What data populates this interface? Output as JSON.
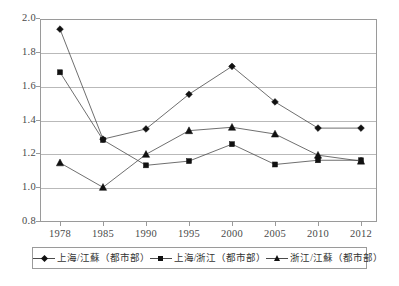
{
  "chart_data": {
    "type": "line",
    "title": "",
    "subtitle": "",
    "xlabel": "",
    "ylabel": "",
    "categories": [
      "1978",
      "1985",
      "1990",
      "1995",
      "2000",
      "2005",
      "2010",
      "2012"
    ],
    "ylim": [
      0.8,
      2.0
    ],
    "yticks": [
      "0.8",
      "1.0",
      "1.2",
      "1.4",
      "1.6",
      "1.8",
      "2.0"
    ],
    "ytick_values": [
      0.8,
      1.0,
      1.2,
      1.4,
      1.6,
      1.8,
      2.0
    ],
    "grid": "horizontal",
    "legend_position": "bottom",
    "series": [
      {
        "name": "上海/江蘇（都市部）",
        "marker": "diamond",
        "color": "#111111",
        "values": [
          1.94,
          1.29,
          1.35,
          1.555,
          1.72,
          1.51,
          1.355,
          1.355
        ]
      },
      {
        "name": "上海/浙江（都市部）",
        "marker": "square",
        "color": "#111111",
        "values": [
          1.685,
          1.285,
          1.135,
          1.16,
          1.26,
          1.14,
          1.165,
          1.165
        ]
      },
      {
        "name": "浙江/江蘇（都市部）",
        "marker": "triangle",
        "color": "#111111",
        "values": [
          1.15,
          1.005,
          1.2,
          1.34,
          1.36,
          1.32,
          1.195,
          1.16
        ]
      }
    ]
  },
  "axes": {
    "y_tick_labels": [
      "2.0",
      "1.8",
      "1.6",
      "1.4",
      "1.2",
      "1.0",
      "0.8"
    ],
    "x_tick_labels": [
      "1978",
      "1985",
      "1990",
      "1995",
      "2000",
      "2005",
      "2010",
      "2012"
    ]
  },
  "legend": {
    "items": [
      {
        "label": "上海/江蘇（都市部）",
        "marker": "diamond"
      },
      {
        "label": "上海/浙江（都市部）",
        "marker": "square"
      },
      {
        "label": "浙江/江蘇（都市部）",
        "marker": "triangle"
      }
    ]
  },
  "colors": {
    "line": "#4a4a4a",
    "marker": "#111111",
    "grid": "#b9b9b9",
    "frame": "#9a9a9a",
    "text": "#3d3d3d",
    "background": "#ffffff"
  }
}
